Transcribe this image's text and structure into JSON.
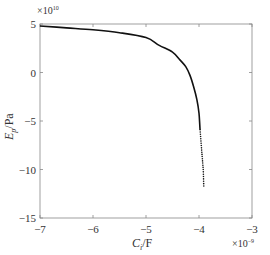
{
  "chart_data": {
    "type": "line",
    "title": "",
    "xlabel": "C_i/F",
    "ylabel": "E_p/Pa",
    "x_multiplier": "×10^-9",
    "y_multiplier": "×10^10",
    "xlim": [
      -7,
      -3
    ],
    "ylim": [
      -15,
      5
    ],
    "xticks": [
      -7,
      -6,
      -5,
      -4,
      -3
    ],
    "yticks": [
      5,
      0,
      -5,
      -10,
      -15
    ],
    "grid": false,
    "legend": null,
    "series": [
      {
        "name": "E_p",
        "x": [
          -7.0,
          -6.5,
          -6.0,
          -5.5,
          -5.0,
          -4.75,
          -4.5,
          -4.36,
          -4.25,
          -4.17,
          -4.1,
          -4.04,
          -4.0,
          -3.98,
          -3.95,
          -3.92,
          -3.91
        ],
        "y": [
          4.8,
          4.6,
          4.4,
          4.1,
          3.6,
          2.8,
          2.1,
          1.3,
          0.6,
          -0.3,
          -1.5,
          -2.8,
          -4.2,
          -5.9,
          -8.0,
          -10.0,
          -11.7
        ]
      }
    ]
  },
  "labels": {
    "y_mult_base": "×10",
    "y_mult_exp": "10",
    "x_mult_base": "×10",
    "x_mult_exp": "−9",
    "xlabel_main": "C",
    "xlabel_sub": "i",
    "xlabel_unit": "/F",
    "ylabel_main": "E",
    "ylabel_sub": "p",
    "ylabel_unit": "/Pa",
    "xtick_labels": [
      "−7",
      "−6",
      "−5",
      "−4",
      "−3"
    ],
    "ytick_labels": [
      "5",
      "0",
      "−5",
      "−10",
      "−15"
    ]
  }
}
